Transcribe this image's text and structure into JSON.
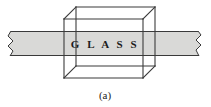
{
  "figure": {
    "caption": "(a)",
    "label": "G L A S S",
    "label_plain": "GLASS",
    "background_color": "#ffffff",
    "beam": {
      "name": "light-beam",
      "fill_color": "#d9d9d7",
      "stroke_color": "#3a3a3a",
      "top_y": 31,
      "bottom_y": 56,
      "left_break_x": 10,
      "right_break_x": 198,
      "break_style": "zigzag"
    },
    "cube": {
      "name": "glass-block",
      "stroke_color": "#3b3b3b",
      "front_left_x": 64,
      "front_right_x": 143,
      "front_top_y": 19,
      "front_bottom_y": 78,
      "depth_dx": 12,
      "depth_dy": -12
    },
    "text_positions": {
      "label_x": 105,
      "label_y": 48,
      "caption_x": 105,
      "caption_y": 99
    }
  }
}
